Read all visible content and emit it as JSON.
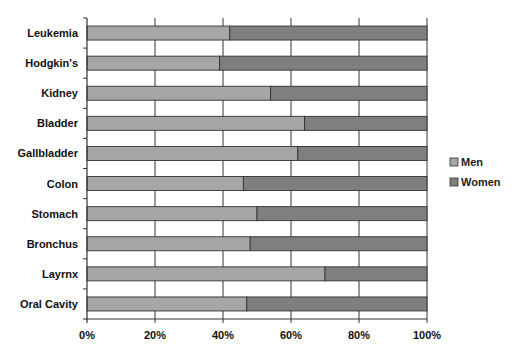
{
  "chart_data": {
    "type": "bar",
    "orientation": "horizontal",
    "stacked": "percent",
    "title": "",
    "xlabel": "",
    "ylabel": "",
    "xlim": [
      0,
      100
    ],
    "x_ticks": [
      "0%",
      "20%",
      "40%",
      "60%",
      "80%",
      "100%"
    ],
    "grid": "vertical",
    "legend_position": "right",
    "categories": [
      "Leukemia",
      "Hodgkin's",
      "Kidney",
      "Bladder",
      "Gallbladder",
      "Colon",
      "Stomach",
      "Bronchus",
      "Layrnx",
      "Oral Cavity"
    ],
    "series": [
      {
        "name": "Men",
        "color": "#a6a6a6",
        "values": [
          42,
          39,
          54,
          64,
          62,
          46,
          50,
          48,
          70,
          47
        ]
      },
      {
        "name": "Women",
        "color": "#7f7f7f",
        "values": [
          58,
          61,
          46,
          36,
          38,
          54,
          50,
          52,
          30,
          53
        ]
      }
    ]
  },
  "legend": {
    "items": [
      {
        "label": "Men",
        "color": "#a6a6a6"
      },
      {
        "label": "Women",
        "color": "#7f7f7f"
      }
    ]
  }
}
